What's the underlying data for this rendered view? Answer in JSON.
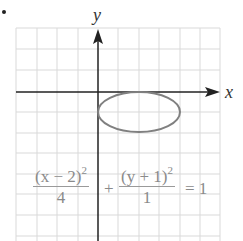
{
  "figure": {
    "bullet": "•",
    "axis_labels": {
      "x": "x",
      "y": "y"
    },
    "grid": {
      "cols": 10,
      "rows": 10,
      "cell_px": 20.4
    },
    "equation": {
      "term1_num": "(x − 2)",
      "term1_exp": "2",
      "term1_den": "4",
      "plus": "+",
      "term2_num": "(y + 1)",
      "term2_exp": "2",
      "term2_den": "1",
      "equals": "= 1"
    },
    "ellipse": {
      "center": [
        2,
        -1
      ],
      "a": 2,
      "b": 1
    },
    "colors": {
      "grid": "#d9d9d9",
      "axis": "#222222",
      "curve": "#808080",
      "text": "#8a8a8a"
    }
  }
}
